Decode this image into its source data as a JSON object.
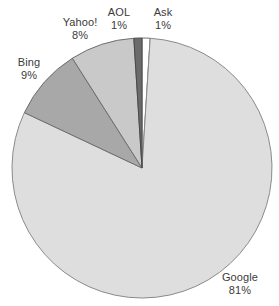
{
  "chart_data": {
    "type": "pie",
    "title": "",
    "subtitle": "",
    "xlabel": "",
    "ylabel": "",
    "legend_position": "none",
    "grid": false,
    "labels_inline": true,
    "units": "%",
    "categories": [
      "Google",
      "Bing",
      "Yahoo!",
      "AOL",
      "Ask"
    ],
    "values": [
      81,
      9,
      8,
      1,
      1
    ],
    "slices": [
      {
        "name": "Ask",
        "value": 1,
        "value_label": "1%",
        "color": "#ffffff",
        "stroke": "#6e6e6e",
        "start_angle_deg": 0,
        "end_angle_deg": 3.6,
        "label_position": "outside-top"
      },
      {
        "name": "Google",
        "value": 81,
        "value_label": "81%",
        "color": "#dedede",
        "stroke": "#8a8a8a",
        "start_angle_deg": 3.6,
        "end_angle_deg": 295.2,
        "label_position": "outside-bottom-right"
      },
      {
        "name": "Bing",
        "value": 9,
        "value_label": "9%",
        "color": "#a8a8a8",
        "stroke": "#6e6e6e",
        "start_angle_deg": 295.2,
        "end_angle_deg": 327.6,
        "label_position": "outside-left"
      },
      {
        "name": "Yahoo!",
        "value": 8,
        "value_label": "8%",
        "color": "#c9c9c9",
        "stroke": "#6e6e6e",
        "start_angle_deg": 327.6,
        "end_angle_deg": 356.4,
        "label_position": "outside-top-left"
      },
      {
        "name": "AOL",
        "value": 1,
        "value_label": "1%",
        "color": "#6b6b6b",
        "stroke": "#4a4a4a",
        "start_angle_deg": 356.4,
        "end_angle_deg": 360,
        "label_position": "outside-top"
      }
    ],
    "geometry": {
      "center_x": 142,
      "center_y": 168,
      "radius": 130
    },
    "colors": {
      "background": "#ffffff",
      "text": "#3b3b3b",
      "outline": "#6e6e6e"
    }
  }
}
